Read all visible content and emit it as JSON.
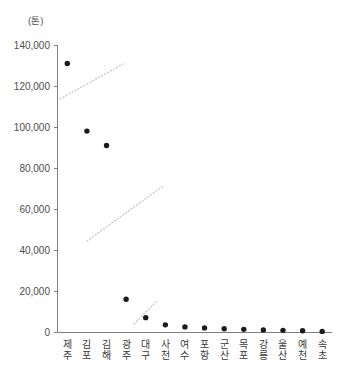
{
  "chart_data": {
    "type": "scatter",
    "title": "",
    "subtitle": "",
    "xlabel": "",
    "ylabel": "",
    "unit_label": "(톤)",
    "categories": [
      "제주",
      "김포",
      "김해",
      "광주",
      "대구",
      "사천",
      "여수",
      "포항",
      "군산",
      "목포",
      "강릉",
      "울산",
      "예천",
      "속초"
    ],
    "categories_romanized": [
      "Jeju",
      "Gimpo",
      "Gimhae",
      "Gwangju",
      "Daegu",
      "Sacheon",
      "Yeosu",
      "Pohang",
      "Gunsan",
      "Mokpo",
      "Gangneung",
      "Ulsan",
      "Yecheon",
      "Sokcho"
    ],
    "values": [
      131000,
      98000,
      91000,
      16000,
      7000,
      3500,
      2500,
      2000,
      1600,
      1300,
      1000,
      800,
      600,
      300
    ],
    "series": [
      {
        "name": "화물 처리량",
        "values": [
          131000,
          98000,
          91000,
          16000,
          7000,
          3500,
          2500,
          2000,
          1600,
          1300,
          1000,
          800,
          600,
          300
        ]
      }
    ],
    "ylim": [
      0,
      140000
    ],
    "ytick_values": [
      0,
      20000,
      40000,
      60000,
      80000,
      100000,
      120000,
      140000
    ],
    "ytick_labels": [
      "0",
      "20,000",
      "40,000",
      "60,000",
      "80,000",
      "100,000",
      "120,000",
      "140,000"
    ],
    "grid": false,
    "legend": "none",
    "marker": "filled-circle",
    "marker_color": "#1a1a1a",
    "axis_color": "#808080",
    "annotation_color": "#c8c8d2",
    "annotations": [
      {
        "name": "break-line-1",
        "type": "dotted-diagonal",
        "x1": 60,
        "y1": 99,
        "x2": 123,
        "y2": 64
      },
      {
        "name": "break-line-2",
        "type": "dotted-diagonal",
        "x1": 87,
        "y1": 241,
        "x2": 163,
        "y2": 186
      },
      {
        "name": "break-line-3",
        "type": "dotted-diagonal",
        "x1": 134,
        "y1": 324,
        "x2": 156,
        "y2": 302
      }
    ]
  }
}
